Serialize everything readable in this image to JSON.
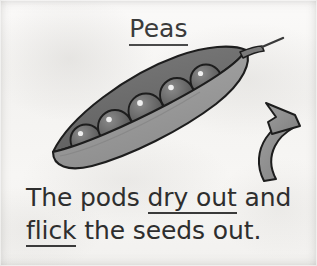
{
  "page": {
    "kind": "worksheet-illustration",
    "background_color": "#f4f3f1",
    "ink_color": "#2e2e2e"
  },
  "title": {
    "text": "Peas",
    "underlined": true
  },
  "caption": {
    "line1": {
      "before": "The pods ",
      "underlined": "dry out",
      "after": " and"
    },
    "line2": {
      "underlined": "flick",
      "after": " the seeds out."
    },
    "full_text": "The pods dry out and flick the seeds out."
  },
  "illustration": {
    "name": "pea-pod-with-peas",
    "pod": {
      "back_half_color": "#6f6f6f",
      "front_half_color": "#9b9b9b",
      "outline_color": "#1d1d1d",
      "stem_color": "#767676"
    },
    "peas": {
      "count": 5,
      "fill_color": "#6a6a6a",
      "highlight_color": "#f2f2f2",
      "outline_color": "#1d1d1d"
    },
    "arrow": {
      "name": "curved-arrow-pointing-to-pod-tip",
      "direction": "up-left",
      "fill_color": "#8f8f8f",
      "outline_color": "#1d1d1d"
    }
  }
}
